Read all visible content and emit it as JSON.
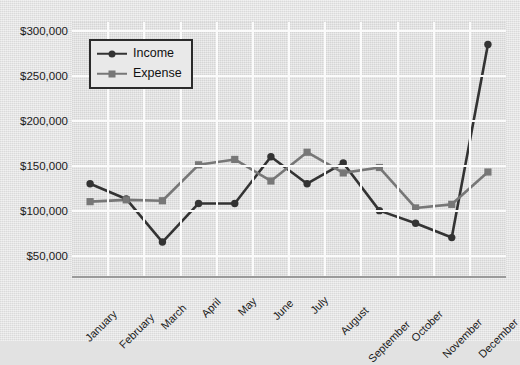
{
  "chart_data": {
    "type": "line",
    "title": "",
    "xlabel": "",
    "ylabel": "",
    "grid": true,
    "legend_position": "top-left",
    "categories": [
      "January",
      "February",
      "March",
      "April",
      "May",
      "June",
      "July",
      "August",
      "September",
      "October",
      "November",
      "December"
    ],
    "ylim": [
      25000,
      310000
    ],
    "yticks": [
      50000,
      100000,
      150000,
      200000,
      250000,
      300000
    ],
    "ytick_labels": [
      "$50,000",
      "$100,000",
      "$150,000",
      "$200,000",
      "$250,000",
      "$300,000"
    ],
    "series": [
      {
        "name": "Income",
        "color": "#333333",
        "marker": "circle",
        "values": [
          130000,
          113000,
          65000,
          108000,
          108000,
          160000,
          130000,
          153000,
          100000,
          86000,
          70000,
          285000
        ]
      },
      {
        "name": "Expense",
        "color": "#777777",
        "marker": "square",
        "values": [
          110000,
          112000,
          111000,
          151000,
          157000,
          133000,
          165000,
          142000,
          148000,
          103000,
          107000,
          143000
        ]
      }
    ]
  },
  "legend": {
    "items": [
      {
        "label": "Income"
      },
      {
        "label": "Expense"
      }
    ]
  },
  "colors": {
    "income": "#333333",
    "expense": "#777777",
    "plot_background": "#dedede",
    "page_background": "#e3e3e3",
    "gridline": "#fbfbfb",
    "axis": "#9a9a9a"
  }
}
